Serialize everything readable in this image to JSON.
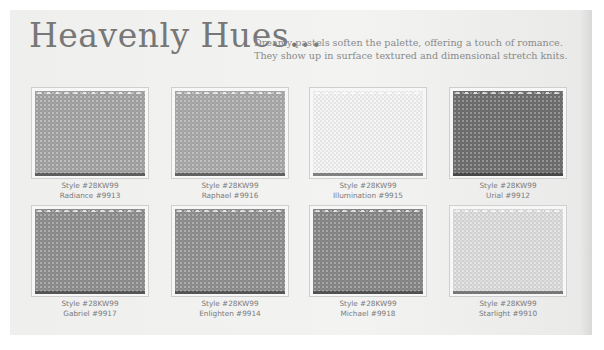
{
  "header": {
    "title": "Heavenly Hues...",
    "tagline_line1": "Dreamy pastels soften the palette, offering a touch of romance.",
    "tagline_line2": "They show up in surface textured and dimensional stretch knits."
  },
  "swatches": [
    {
      "style": "Style #28KW99",
      "name": "Radiance #9913",
      "color": "#a3a3a3"
    },
    {
      "style": "Style #28KW99",
      "name": "Raphael #9916",
      "color": "#a9a9a9"
    },
    {
      "style": "Style #28KW99",
      "name": "Illumination #9915",
      "color": "#f2f2f2"
    },
    {
      "style": "Style #28KW99",
      "name": "Urial #9912",
      "color": "#6e6e6e"
    },
    {
      "style": "Style #28KW99",
      "name": "Gabriel #9917",
      "color": "#8e8e8e"
    },
    {
      "style": "Style #28KW99",
      "name": "Enlighten #9914",
      "color": "#8f8f8f"
    },
    {
      "style": "Style #28KW99",
      "name": "Michael #9918",
      "color": "#878787"
    },
    {
      "style": "Style #28KW99",
      "name": "Starlight #9910",
      "color": "#dcdcdc"
    }
  ]
}
